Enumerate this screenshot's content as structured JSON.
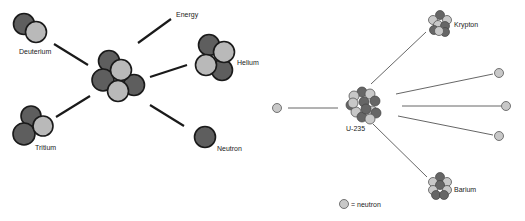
{
  "colors": {
    "proton": "#5e5e5e",
    "neutron": "#b9b9b9",
    "outline": "#1a1a1a",
    "line": "#1a1a1a",
    "fission_line": "#555555"
  },
  "fusion": {
    "labels": {
      "deuterium": "Deuterium",
      "tritium": "Tritium",
      "energy": "Energy",
      "helium": "Helium",
      "neutron": "Neutron"
    }
  },
  "fission": {
    "labels": {
      "u235": "U-235",
      "krypton": "Krypton",
      "barium": "Barium"
    },
    "legend": "= neutron",
    "emitted_neutrons": 3
  }
}
